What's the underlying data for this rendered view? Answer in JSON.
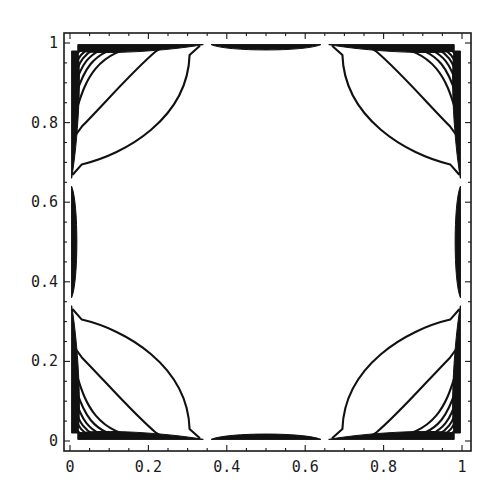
{
  "chart_data": {
    "type": "contour",
    "title": "",
    "xlabel": "",
    "ylabel": "",
    "xlim": [
      0,
      1
    ],
    "ylim": [
      0,
      1
    ],
    "grid": false,
    "legend": null,
    "x_ticks": [
      {
        "value": 0,
        "label": "0"
      },
      {
        "value": 0.2,
        "label": "0.2"
      },
      {
        "value": 0.4,
        "label": "0.4"
      },
      {
        "value": 0.6,
        "label": "0.6"
      },
      {
        "value": 0.8,
        "label": "0.8"
      },
      {
        "value": 1,
        "label": "1"
      }
    ],
    "y_ticks": [
      {
        "value": 0,
        "label": "0"
      },
      {
        "value": 0.2,
        "label": "0.2"
      },
      {
        "value": 0.4,
        "label": "0.4"
      },
      {
        "value": 0.6,
        "label": "0.6"
      },
      {
        "value": 0.8,
        "label": "0.8"
      },
      {
        "value": 1,
        "label": "1"
      }
    ],
    "corner_contour_levels_intercepts": [
      0.33,
      0.24,
      0.19,
      0.15,
      0.12,
      0.095,
      0.075,
      0.055
    ],
    "edge_lenses": [
      {
        "edge": "bottom",
        "from": 0.36,
        "to": 0.64
      },
      {
        "edge": "top",
        "from": 0.36,
        "to": 0.64
      },
      {
        "edge": "left",
        "from": 0.36,
        "to": 0.64
      },
      {
        "edge": "right",
        "from": 0.36,
        "to": 0.64
      }
    ],
    "symmetry": "fourfold (reflections about x=0.5 and y=0.5)",
    "line_color": "#111111",
    "background": "#ffffff"
  }
}
